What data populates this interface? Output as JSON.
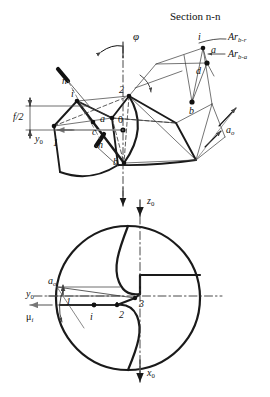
{
  "figure": {
    "title": "Section n-n",
    "background": "#ffffff",
    "line_color": "#1a1a1a",
    "thin_color": "#555555",
    "dash_color": "#333333"
  },
  "section_view": {
    "name": "section-n-n-view",
    "labels": {
      "angle_phi": "φ",
      "point_1": "1",
      "point_2": "2",
      "point_0": "0",
      "point_a": "a",
      "point_b": "b",
      "point_c": "c",
      "point_d": "d",
      "point_i": "i",
      "cut_n_upper": "n",
      "cut_n_lower": "n",
      "dim_f_half": "f/2",
      "axis_y0": "y",
      "axis_y0_sub": "0",
      "dim_a0": "a",
      "dim_a0_sub": "o",
      "leader_ar_br": "Ar",
      "leader_ar_br_sub": "b-r",
      "leader_ar_ba": "Ar",
      "leader_ar_ba_sub": "b-a"
    }
  },
  "end_view": {
    "name": "drill-end-view",
    "labels": {
      "axis_z0": "z",
      "axis_z0_sub": "0",
      "axis_x0": "x",
      "axis_x0_sub": "0",
      "axis_y0": "y",
      "axis_y0_sub": "0",
      "dim_a0": "a",
      "dim_a0_sub": "o",
      "angle_mu_i": "μ",
      "angle_mu_i_sub": "i",
      "point_1": "1",
      "point_2": "2",
      "point_3": "3",
      "point_i": "i"
    }
  }
}
